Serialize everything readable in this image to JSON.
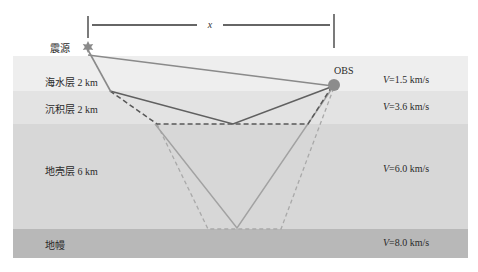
{
  "diagram": {
    "type": "seismic refraction ray-path schematic",
    "offset_label": "x",
    "source_label": "震源",
    "receiver_label": "OBS",
    "layers": [
      {
        "name": "海水层 2 km",
        "velocity_prefix": "V",
        "velocity": "=1.5 km/s",
        "color": "#eeeeee"
      },
      {
        "name": "沉积层 2 km",
        "velocity_prefix": "V",
        "velocity": "=3.6 km/s",
        "color": "#e2e2e2"
      },
      {
        "name": "地壳层 6 km",
        "velocity_prefix": "V",
        "velocity": "=6.0 km/s",
        "color": "#d6d6d6"
      },
      {
        "name": "地幔",
        "velocity_prefix": "V",
        "velocity": "=8.0 km/s",
        "color": "#b7b7b7"
      }
    ],
    "colors": {
      "direct_ray": "#8a8a8a",
      "sediment_ray": "#5a5a5a",
      "crust_ray": "#a5a5a5",
      "source_star": "#8c8c8c",
      "obs_circle": "#8c8c8c",
      "dimension_line": "#333333"
    }
  }
}
